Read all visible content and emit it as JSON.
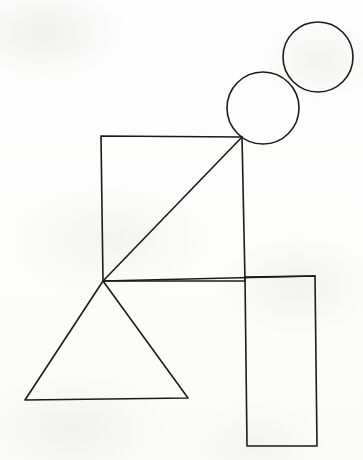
{
  "canvas": {
    "width": 363,
    "height": 460,
    "background_color": "#fdfdfc",
    "stroke_color": "#1b1b1b",
    "stroke_width": 1.6,
    "medium": "pen-line-drawing-on-paper",
    "title": "Geometric line drawing of stacked shapes"
  },
  "shapes": [
    {
      "id": "circle-upper-right",
      "name": "circle",
      "role": "small head circle, upper right, overlaps lower circle",
      "cx": 318,
      "cy": 57,
      "r": 35
    },
    {
      "id": "circle-lower-left",
      "name": "circle",
      "role": "larger head circle, rests on square top-right corner",
      "cx": 263,
      "cy": 108,
      "r": 36
    },
    {
      "id": "square-body",
      "name": "square",
      "role": "large square forming torso",
      "points": "101,136 242,137 245,281 103,281"
    },
    {
      "id": "diagonal-brace",
      "name": "line",
      "role": "diagonal from square bottom-left corner to top-right corner",
      "points": "103,281 242,137"
    },
    {
      "id": "triangle-legs",
      "name": "triangle",
      "role": "triangle below square, apex at square bottom-left corner",
      "points": "103,281 188,398 25,400"
    },
    {
      "id": "rectangle-tall",
      "name": "rectangle",
      "role": "tall vertical rectangle on right, overlapping square edge",
      "points": "245,277 315,276 317,446 247,446"
    },
    {
      "id": "horizontal-top-rail",
      "name": "line",
      "role": "horizontal rail from square bottom-left corner across to rectangle top-right",
      "points": "103,281 315,276"
    }
  ],
  "vertices": {
    "junction_point": {
      "x": 103,
      "y": 281,
      "label": "shared corner: square bottom-left, triangle apex, rail left end"
    },
    "square_top_right": {
      "x": 242,
      "y": 137,
      "label": "square top-right corner touching lower circle"
    }
  }
}
